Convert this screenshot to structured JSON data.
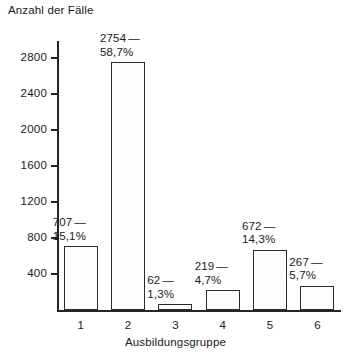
{
  "chart_data": {
    "type": "bar",
    "title": "",
    "ylabel": "Anzahl der Fälle",
    "xlabel": "Ausbildungsgruppe",
    "categories": [
      "1",
      "2",
      "3",
      "4",
      "5",
      "6"
    ],
    "values": [
      707,
      2754,
      62,
      219,
      672,
      267
    ],
    "percent_labels": [
      "15,1%",
      "58,7%",
      "1,3%",
      "4,7%",
      "14,3%",
      "5,7%"
    ],
    "value_labels": [
      "707",
      "2754",
      "62",
      "219",
      "672",
      "267"
    ],
    "label_dash": "—",
    "ylim": [
      0,
      2900
    ],
    "yticks": [
      400,
      800,
      1200,
      1600,
      2000,
      2400,
      2800
    ],
    "ytick_labels": [
      "400",
      "800",
      "1200",
      "1600",
      "2000",
      "2400",
      "2800"
    ],
    "grid": false,
    "legend": false,
    "bar_fill": "#fdfdfd",
    "bar_pattern": "dotted-stipple",
    "bar_edge_color": "#2b2b2b",
    "axis_color": "#262626"
  }
}
